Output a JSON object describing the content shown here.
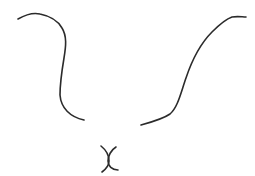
{
  "sketch": {
    "background": "#ffffff",
    "stroke_color": "#2b2b2b",
    "stroke_width": 1.6,
    "strokes": [
      {
        "name": "left-curve",
        "d": "M18 19 C 25 15, 32 12, 40 14 C 50 16, 58 21, 62 28 C 67 36, 66 46, 64 58 C 62 70, 60 82, 60 95 C 61 108, 70 117, 84 120"
      },
      {
        "name": "right-curve",
        "d": "M141 125 C 152 122, 163 119, 170 114 C 178 107, 181 92, 186 78 C 192 60, 200 44, 212 32 C 220 24, 226 19, 232 17 C 238 16, 242 17, 246 17"
      },
      {
        "name": "cross-left-arc",
        "d": "M101 146 C 106 150, 109 156, 109 161 C 109 166, 106 169, 102 172"
      },
      {
        "name": "cross-right-arc",
        "d": "M116 147 C 111 150, 108 156, 108 161 C 108 166, 112 170, 118 170"
      }
    ]
  }
}
